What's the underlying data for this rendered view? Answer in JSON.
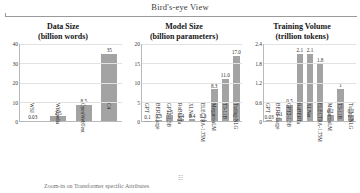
{
  "header": {
    "title": "Bird's-eye View"
  },
  "footer": {
    "note": "Zoom-in on Transformer specific Attributes",
    "mark": "☷"
  },
  "chart_data": [
    {
      "type": "bar",
      "id": "data-size",
      "title": "Data Size",
      "subtitle": "(billion words)",
      "xlabel": "",
      "ylabel": "",
      "categories": [
        "WSJ",
        "Wikipedia",
        "OpenWebText",
        "C4"
      ],
      "values": [
        0.03,
        2.5,
        8.5,
        35
      ],
      "value_labels": [
        "0.03",
        "2.5",
        "8.5",
        "35"
      ],
      "yticks": [
        40,
        30,
        20,
        10,
        0
      ],
      "ytick_labels": [
        "40",
        "30",
        "20",
        "10",
        "0"
      ],
      "ylim": [
        0,
        40
      ],
      "grid": true,
      "legend": "none",
      "bar_color": "#a3a3a3"
    },
    {
      "type": "bar",
      "id": "model-size",
      "title": "Model Size",
      "subtitle": "(billion parameters)",
      "xlabel": "",
      "ylabel": "",
      "categories": [
        "GPT",
        "BERT-Large",
        "GPT2-1.5B",
        "RoBERTa",
        "XLNet",
        "ELECTRA-1.75M",
        "MegatronLM",
        "T5-11B",
        "Turing-NLG"
      ],
      "values": [
        0.1,
        0.3,
        1.5,
        0.4,
        0.4,
        0.3,
        8.3,
        11.0,
        17.0
      ],
      "value_labels": [
        "0.1",
        "0.3",
        "1.5",
        "0.4",
        "0.4",
        "0.3",
        "8.3",
        "11.0",
        "17.0"
      ],
      "yticks": [
        20,
        15,
        10,
        5,
        0
      ],
      "ytick_labels": [
        "20",
        "15",
        "10",
        "5",
        "0"
      ],
      "ylim": [
        0,
        20
      ],
      "grid": true,
      "legend": "none",
      "bar_color": "#a3a3a3"
    },
    {
      "type": "bar",
      "id": "training-volume",
      "title": "Training Volume",
      "subtitle": "(trillion tokens)",
      "xlabel": "",
      "ylabel": "",
      "categories": [
        "GPT",
        "BERT-Large",
        "GPT2-1.5B",
        "RoBERTa",
        "XLNet",
        "ELECTRA-1.75M",
        "MegatronLM",
        "T5-11B",
        "Turing-NLG"
      ],
      "values": [
        0.03,
        0.1,
        0.5,
        2.1,
        2.1,
        1.8,
        0.2,
        1.0,
        0.2
      ],
      "value_labels": [
        "0.03",
        "0.1",
        "0.5",
        "2.1",
        "2.1",
        "1.8",
        "0.2",
        "1",
        "0.2"
      ],
      "yticks": [
        2.4,
        1.8,
        1.2,
        0.6,
        0
      ],
      "ytick_labels": [
        "2.4",
        "1.8",
        "1.2",
        "0.6",
        "0"
      ],
      "ylim": [
        0,
        2.4
      ],
      "grid": true,
      "legend": "none",
      "bar_color": "#a3a3a3"
    }
  ]
}
